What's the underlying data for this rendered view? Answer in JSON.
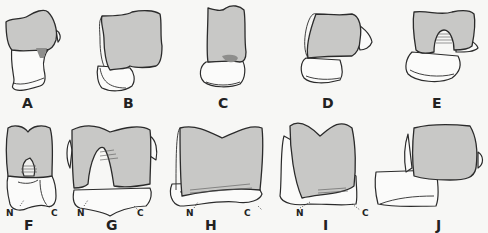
{
  "figure": {
    "colors": {
      "background": "#f7f7f5",
      "articular_surface": "#c8c8c6",
      "outline": "#2b2b2b"
    },
    "panels": [
      {
        "label": "A"
      },
      {
        "label": "B"
      },
      {
        "label": "C"
      },
      {
        "label": "D"
      },
      {
        "label": "E"
      },
      {
        "label": "F",
        "annotations": [
          "N",
          "C"
        ]
      },
      {
        "label": "G",
        "annotations": [
          "N",
          "C"
        ]
      },
      {
        "label": "H",
        "annotations": [
          "N",
          "C"
        ]
      },
      {
        "label": "I",
        "annotations": [
          "N",
          "C"
        ]
      },
      {
        "label": "J"
      }
    ]
  }
}
